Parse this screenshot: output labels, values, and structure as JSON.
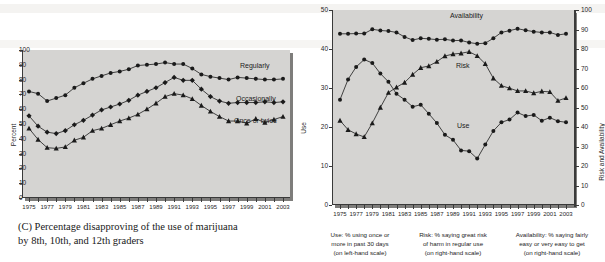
{
  "chart_data": [
    {
      "type": "line",
      "panel": "C",
      "title": "",
      "caption_line1": "(C) Percentage disapproving of the use of marijuana",
      "caption_line2": "by 8th, 10th, and 12th graders",
      "xlabel": "",
      "ylabel": "Percent",
      "ylim": [
        0,
        100
      ],
      "yticks": [
        0,
        10,
        20,
        30,
        40,
        50,
        60,
        70,
        80,
        90,
        100
      ],
      "xlim": [
        1975,
        2003
      ],
      "xtick_labels": [
        "1975",
        "1977",
        "1979",
        "1981",
        "1983",
        "1985",
        "1987",
        "1989",
        "1991",
        "1993",
        "1995",
        "1997",
        "1999",
        "2001",
        "2003"
      ],
      "x": [
        1975,
        1976,
        1977,
        1978,
        1979,
        1980,
        1981,
        1982,
        1983,
        1984,
        1985,
        1986,
        1987,
        1988,
        1989,
        1990,
        1991,
        1992,
        1993,
        1994,
        1995,
        1996,
        1997,
        1998,
        1999,
        2000,
        2001,
        2002,
        2003
      ],
      "grid": false,
      "legend": "inline-right",
      "series": [
        {
          "name": "Regularly",
          "marker": "circle",
          "values": [
            72.0,
            70.5,
            65.5,
            67.5,
            69.5,
            74.5,
            77.5,
            80.5,
            82.5,
            84.5,
            85.5,
            87.0,
            89.5,
            90.0,
            90.5,
            91.5,
            90.5,
            90.5,
            87.5,
            83.5,
            82.0,
            81.0,
            80.0,
            81.5,
            81.0,
            80.5,
            80.0,
            80.0,
            80.5
          ]
        },
        {
          "name": "Occasionally",
          "marker": "diamond",
          "values": [
            55.5,
            48.5,
            44.5,
            43.5,
            45.5,
            49.5,
            52.5,
            56.0,
            59.5,
            61.5,
            63.5,
            66.0,
            69.5,
            72.0,
            74.5,
            78.0,
            81.5,
            79.5,
            79.5,
            73.5,
            68.5,
            65.5,
            64.0,
            64.5,
            64.5,
            64.5,
            65.0,
            64.5,
            65.0
          ]
        },
        {
          "name": "Once or twice",
          "marker": "triangle",
          "values": [
            47.0,
            39.5,
            34.0,
            33.5,
            34.5,
            39.0,
            41.0,
            45.5,
            47.0,
            49.5,
            52.0,
            54.0,
            56.5,
            60.0,
            64.0,
            68.5,
            70.5,
            69.5,
            67.0,
            62.5,
            58.5,
            55.0,
            52.0,
            52.0,
            50.5,
            53.5,
            51.0,
            53.0,
            55.0
          ]
        }
      ]
    },
    {
      "type": "line",
      "panel": "D",
      "title": "",
      "ylabel_left": "Use",
      "ylabel_right": "Risk and Availability",
      "ylim_left": [
        0,
        50
      ],
      "yticks_left": [
        0,
        10,
        20,
        30,
        40,
        50
      ],
      "ylim_right": [
        0,
        100
      ],
      "yticks_right": [
        0,
        10,
        20,
        30,
        40,
        50,
        60,
        70,
        80,
        90,
        100
      ],
      "xlim": [
        1975,
        2003
      ],
      "xtick_labels": [
        "1975",
        "1977",
        "1979",
        "1981",
        "1983",
        "1985",
        "1987",
        "1989",
        "1991",
        "1993",
        "1995",
        "1997",
        "1999",
        "2001",
        "2003"
      ],
      "x": [
        1975,
        1976,
        1977,
        1978,
        1979,
        1980,
        1981,
        1982,
        1983,
        1984,
        1985,
        1986,
        1987,
        1988,
        1989,
        1990,
        1991,
        1992,
        1993,
        1994,
        1995,
        1996,
        1997,
        1998,
        1999,
        2000,
        2001,
        2002,
        2003
      ],
      "grid": false,
      "legend": "inline",
      "series": [
        {
          "name": "Use",
          "axis": "left",
          "marker": "circle",
          "values": [
            27.0,
            32.2,
            35.4,
            37.3,
            36.4,
            33.7,
            31.6,
            28.5,
            27.0,
            25.2,
            25.7,
            23.4,
            21.0,
            18.0,
            16.7,
            14.0,
            13.8,
            11.9,
            15.5,
            19.0,
            21.2,
            21.9,
            23.7,
            22.8,
            23.1,
            21.6,
            22.4,
            21.5,
            21.2
          ]
        },
        {
          "name": "Risk",
          "axis": "right",
          "marker": "triangle",
          "values": [
            43.3,
            38.6,
            36.4,
            34.9,
            42.0,
            50.0,
            57.6,
            60.4,
            62.8,
            66.9,
            70.4,
            71.3,
            73.5,
            76.4,
            77.4,
            77.8,
            78.6,
            76.5,
            72.4,
            65.0,
            61.2,
            59.9,
            58.5,
            58.5,
            57.4,
            58.3,
            58.0,
            53.5,
            54.9
          ]
        },
        {
          "name": "Availability",
          "axis": "right",
          "marker": "circle",
          "values": [
            87.8,
            87.8,
            87.9,
            87.9,
            90.1,
            89.5,
            89.2,
            88.5,
            86.2,
            84.6,
            85.5,
            85.2,
            84.8,
            85.0,
            84.3,
            84.4,
            83.3,
            82.7,
            83.0,
            85.5,
            88.5,
            89.4,
            90.4,
            89.6,
            88.9,
            88.5,
            88.5,
            87.2,
            87.8
          ]
        }
      ],
      "footnotes": [
        {
          "lines": [
            "Use: % using once or",
            "more in past 30 days",
            "(on left-hand scale)"
          ]
        },
        {
          "lines": [
            "Risk: % saying great risk",
            "of harm in regular use",
            "(on right-hand scale)"
          ]
        },
        {
          "lines": [
            "Availability: % saying fairly",
            "easy or very easy to get",
            "(on right-hand scale)"
          ]
        }
      ]
    }
  ],
  "colors": {
    "plot_background": "#d5d4d2",
    "axis": "#3a3a3a",
    "series": "#1a1a1a",
    "page_background": "#ffffff"
  }
}
